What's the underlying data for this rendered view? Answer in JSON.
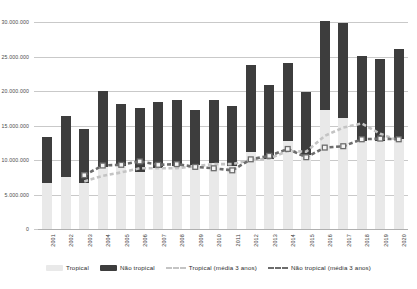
{
  "chart_data": {
    "type": "bar",
    "subtype": "stacked-bar-with-lines",
    "title": "",
    "subtitle": "",
    "xlabel": "",
    "ylabel": "",
    "ylim": [
      0,
      30000000
    ],
    "grid": true,
    "legend_position": "bottom",
    "categories": [
      "2001",
      "2002",
      "2003",
      "2004",
      "2005",
      "2006",
      "2007",
      "2008",
      "2009",
      "2010",
      "2011",
      "2012",
      "2013",
      "2014",
      "2015",
      "2016",
      "2017",
      "2018",
      "2019",
      "2020"
    ],
    "y_ticks": [
      0,
      5000000,
      10000000,
      15000000,
      20000000,
      25000000,
      30000000
    ],
    "y_tick_labels": [
      "0",
      "5.000.000",
      "10.000.000",
      "15.000.000",
      "20.000.000",
      "25.000.000",
      "30.000.000"
    ],
    "series": [
      {
        "name": "Tropical",
        "kind": "bar-stack-bottom",
        "color": "#e9e9e9",
        "values": [
          6600000,
          7500000,
          6700000,
          9000000,
          9100000,
          8300000,
          8900000,
          9200000,
          9300000,
          9600000,
          9200000,
          11200000,
          10100000,
          12700000,
          10700000,
          17200000,
          16100000,
          12700000,
          12700000,
          13000000
        ]
      },
      {
        "name": "Não tropical",
        "kind": "bar-stack-top",
        "color": "#3d3d3d",
        "values": [
          6700000,
          8900000,
          7800000,
          11000000,
          9000000,
          9300000,
          9500000,
          9500000,
          7900000,
          9100000,
          8600000,
          12600000,
          10800000,
          11300000,
          9200000,
          12900000,
          13800000,
          12400000,
          11900000,
          13100000
        ]
      },
      {
        "name": "Tropical (média 3 anos)",
        "kind": "line-dashed",
        "color": "#c4c4c4",
        "values": [
          null,
          null,
          6900000,
          7700000,
          8200000,
          8800000,
          8800000,
          8800000,
          9100000,
          9400000,
          9400000,
          10000000,
          10200000,
          11300000,
          11200000,
          13500000,
          14700000,
          15300000,
          13800000,
          12800000
        ]
      },
      {
        "name": "Não tropical (média 3 anos)",
        "kind": "line-dashed-markers",
        "color": "#6d6d6d",
        "values": [
          null,
          null,
          7800000,
          9200000,
          9300000,
          9800000,
          9300000,
          9400000,
          9000000,
          8800000,
          8500000,
          10100000,
          10600000,
          11600000,
          10400000,
          11800000,
          12000000,
          13000000,
          13100000,
          13000000
        ]
      }
    ]
  },
  "legend": {
    "items": [
      {
        "label": "Tropical",
        "swatch": "solid-light",
        "color": "#e9e9e9"
      },
      {
        "label": "Não tropical",
        "swatch": "solid-dark",
        "color": "#3d3d3d"
      },
      {
        "label": "Tropical (média 3 anos)",
        "swatch": "dashed-light",
        "color": "#c4c4c4"
      },
      {
        "label": "Não tropical (média 3 anos)",
        "swatch": "dashed-dark",
        "color": "#6d6d6d"
      }
    ]
  },
  "colors": {
    "tropical": "#e9e9e9",
    "nao_tropical": "#3d3d3d",
    "trend_tropical": "#c4c4c4",
    "trend_nao_tropical": "#6d6d6d",
    "grid": "#c9c9c9",
    "text": "#3b3b3b",
    "background": "#ffffff"
  }
}
